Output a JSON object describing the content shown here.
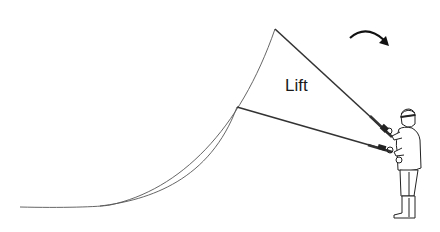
{
  "diagram": {
    "label": "Lift",
    "colors": {
      "line": "#555555",
      "rod": "#333333",
      "figure": "#222222",
      "arrow": "#111111",
      "background": "#ffffff"
    },
    "elements": {
      "upper_rod": "raised rod position",
      "lower_rod": "starting rod position",
      "upper_line": "fly line from raised rod tip",
      "lower_line": "fly line from lower rod tip",
      "rotation_arrow": "clockwise arrow indicating lift motion",
      "angler": "standing angler holding rod"
    }
  }
}
